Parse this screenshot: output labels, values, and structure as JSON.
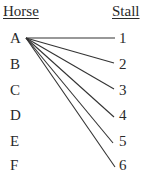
{
  "headers": {
    "left": "Horse",
    "right": "Stall"
  },
  "horses": [
    "A",
    "B",
    "C",
    "D",
    "E",
    "F"
  ],
  "stalls": [
    "1",
    "2",
    "3",
    "4",
    "5",
    "6"
  ],
  "connections": [
    {
      "from": "A",
      "to": "1"
    },
    {
      "from": "A",
      "to": "2"
    },
    {
      "from": "A",
      "to": "3"
    },
    {
      "from": "A",
      "to": "4"
    },
    {
      "from": "A",
      "to": "5"
    },
    {
      "from": "A",
      "to": "6"
    }
  ],
  "colors": {
    "text": "#2a2a2a",
    "line": "#333333",
    "background": "#ffffff"
  }
}
